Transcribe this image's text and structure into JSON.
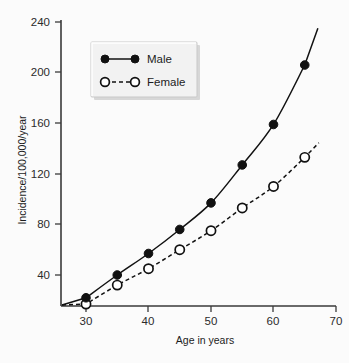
{
  "chart_data": {
    "type": "line",
    "title": "",
    "subtitle": "",
    "xlabel": "Age in years",
    "ylabel": "Incidence/100,000/year",
    "xlim": [
      26,
      70
    ],
    "ylim": [
      0,
      240
    ],
    "xticks": [
      30,
      40,
      50,
      60,
      70
    ],
    "yticks": [
      40,
      80,
      120,
      160,
      200,
      240
    ],
    "xtick_labels": [
      "30",
      "40",
      "50",
      "60",
      "70"
    ],
    "ytick_labels": [
      "40",
      "80",
      "120",
      "160",
      "200",
      "240"
    ],
    "grid": false,
    "legend_position": "upper-left-inside",
    "x": [
      30,
      35,
      40,
      45,
      50,
      55,
      60,
      65
    ],
    "series": [
      {
        "name": "Male",
        "marker": "filled-circle",
        "linestyle": "solid",
        "color": "#111111",
        "values": [
          22,
          40,
          57,
          76,
          97,
          127,
          159,
          206
        ]
      },
      {
        "name": "Female",
        "marker": "open-circle",
        "linestyle": "dashed",
        "color": "#111111",
        "values": [
          17,
          32,
          45,
          60,
          75,
          93,
          110,
          133
        ]
      }
    ]
  },
  "legend": {
    "entries": [
      {
        "label": "Male"
      },
      {
        "label": "Female"
      }
    ]
  },
  "axes": {
    "x_title": "Age in years",
    "y_title": "Incidence/100,000/year"
  },
  "colors": {
    "ink": "#111111",
    "axis": "#3a3a3a",
    "background": "#fbfbfb",
    "legend_face": "#f2f2f2"
  }
}
